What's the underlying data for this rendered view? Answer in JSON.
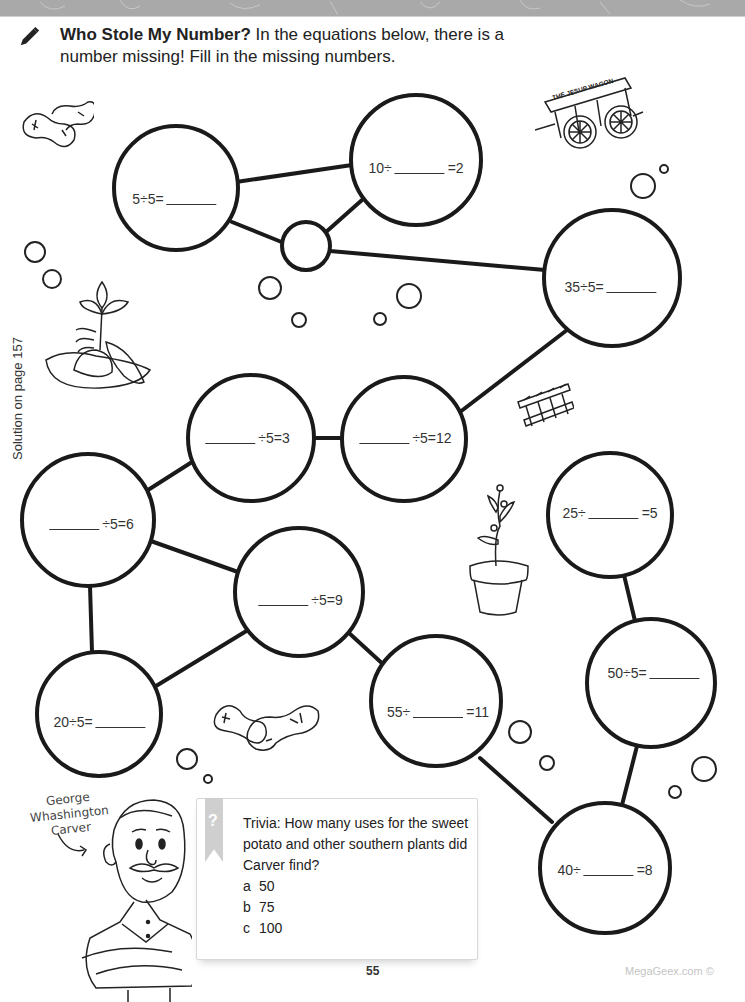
{
  "header": {
    "bar_color": "#a9a9a9"
  },
  "instructions": {
    "icon": "pencil-icon",
    "title": "Who Stole My Number?",
    "body": " In the equations below, there is a number missing!  Fill in the missing numbers."
  },
  "side_note": "Solution on page 157",
  "equations": [
    {
      "id": "a",
      "before": "5÷5=",
      "after": "",
      "blank_position": "end"
    },
    {
      "id": "b",
      "before": "10÷",
      "after": "=2",
      "blank_position": "middle"
    },
    {
      "id": "c",
      "before": "35÷5=",
      "after": "",
      "blank_position": "end"
    },
    {
      "id": "d",
      "before": "",
      "after": "÷5=3",
      "blank_position": "start"
    },
    {
      "id": "e",
      "before": "",
      "after": "÷5=12",
      "blank_position": "start"
    },
    {
      "id": "f",
      "before": "",
      "after": "÷5=6",
      "blank_position": "start"
    },
    {
      "id": "g",
      "before": "",
      "after": "÷5=9",
      "blank_position": "start"
    },
    {
      "id": "h",
      "before": "25÷",
      "after": "=5",
      "blank_position": "middle"
    },
    {
      "id": "i",
      "before": "50÷5=",
      "after": "",
      "blank_position": "end"
    },
    {
      "id": "j",
      "before": "20÷5=",
      "after": "",
      "blank_position": "end"
    },
    {
      "id": "k",
      "before": "55÷",
      "after": "=11",
      "blank_position": "middle"
    },
    {
      "id": "l",
      "before": "40÷",
      "after": "=8",
      "blank_position": "middle"
    }
  ],
  "illustrations": {
    "wagon_label": "THE JESUP WAGON",
    "carver_label": [
      "George",
      "Whashington",
      "Carver"
    ]
  },
  "trivia": {
    "icon": "question-mark-icon",
    "label": "Trivia:",
    "question": " How many uses for the sweet potato and other southern plants did Carver find?",
    "options": [
      {
        "letter": "a",
        "value": "50"
      },
      {
        "letter": "b",
        "value": "75"
      },
      {
        "letter": "c",
        "value": "100"
      }
    ]
  },
  "footer": {
    "page_number": "55",
    "credit": "MegaGeex.com ©"
  }
}
